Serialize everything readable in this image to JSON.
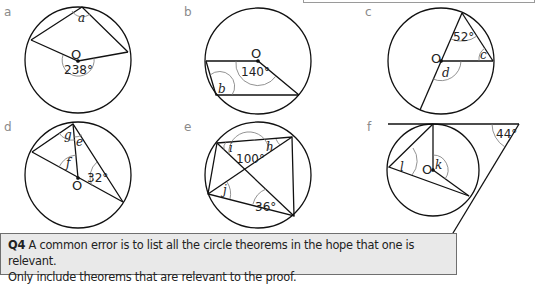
{
  "figures": [
    {
      "id": "a",
      "label": "a",
      "centre_label": "O",
      "given_angle": "238°",
      "unknowns": [
        "a"
      ]
    },
    {
      "id": "b",
      "label": "b",
      "centre_label": "O",
      "given_angle": "140°",
      "unknowns": [
        "b"
      ]
    },
    {
      "id": "c",
      "label": "c",
      "centre_label": "O",
      "given_angle": "52°",
      "unknowns": [
        "c",
        "d"
      ]
    },
    {
      "id": "d",
      "label": "d",
      "centre_label": "O",
      "given_angle": "32°",
      "unknowns": [
        "g",
        "e",
        "f"
      ]
    },
    {
      "id": "e",
      "label": "e",
      "given_angles": [
        "100°",
        "36°"
      ],
      "unknowns": [
        "i",
        "h",
        "j"
      ]
    },
    {
      "id": "f",
      "label": "f",
      "centre_label": "O",
      "given_angle": "44°",
      "unknowns": [
        "l",
        "k"
      ]
    }
  ],
  "hint": {
    "tag": "Q4",
    "text": " A common error is to list all the circle theorems in the hope that one is relevant.",
    "text2": "Only include theorems that are relevant to the proof."
  }
}
